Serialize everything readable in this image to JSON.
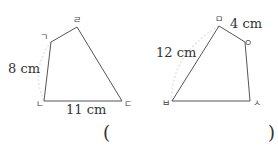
{
  "figures": [
    {
      "name": "left-quadrilateral",
      "vertices": [
        {
          "label": "ㄱ",
          "x": 51,
          "y": 42
        },
        {
          "label": "ㄹ",
          "x": 77,
          "y": 27
        },
        {
          "label": "ㄷ",
          "x": 122,
          "y": 101
        },
        {
          "label": "ㄴ",
          "x": 44,
          "y": 101
        }
      ],
      "measurements": [
        {
          "text": "8 cm",
          "side": "ㄱㄴ"
        },
        {
          "text": "11 cm",
          "side": "ㄴㄷ"
        }
      ]
    },
    {
      "name": "right-quadrilateral",
      "vertices": [
        {
          "label": "ㅁ",
          "x": 219,
          "y": 26
        },
        {
          "label": "ㅇ",
          "x": 245,
          "y": 42
        },
        {
          "label": "ㅅ",
          "x": 250,
          "y": 101
        },
        {
          "label": "ㅂ",
          "x": 172,
          "y": 101
        }
      ],
      "measurements": [
        {
          "text": "12 cm",
          "side": "ㅁㅂ"
        },
        {
          "text": "4 cm",
          "side": "ㅁㅇ"
        }
      ]
    }
  ],
  "answer": {
    "open": "(",
    "close": ")"
  }
}
